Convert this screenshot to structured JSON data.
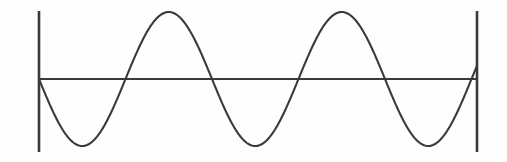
{
  "figure": {
    "kind": "line-diagram",
    "width": 507,
    "height": 162,
    "background_color": "#fefefe",
    "ink_color": "#3a3a3a"
  },
  "chart_data": {
    "type": "line",
    "title": "",
    "subtitle": "",
    "xlabel": "",
    "ylabel": "",
    "grid": false,
    "legend": null,
    "annotations": [],
    "xlim": [
      39,
      477
    ],
    "ylim": [
      11,
      152
    ],
    "baseline_y": 79,
    "amplitude_px": 67,
    "period_px": 173,
    "cycles": 2.53,
    "phase": "starts at zero descending",
    "axis": {
      "name": "horizontal-baseline",
      "x_start": 39,
      "x_end": 477,
      "y": 79,
      "stroke_width": 1.9,
      "color": "#3a3a3a"
    },
    "end_bars": [
      {
        "name": "left-end-bar",
        "x": 39,
        "y_top": 11,
        "y_bottom": 152,
        "stroke_width": 2.6,
        "color": "#3a3a3a"
      },
      {
        "name": "right-end-bar",
        "x": 477,
        "y_top": 11,
        "y_bottom": 152,
        "stroke_width": 2.6,
        "color": "#3a3a3a"
      }
    ],
    "wave": {
      "name": "sine-curve",
      "stroke_width": 2.1,
      "color": "#3a3a3a",
      "key_points": [
        {
          "label": "start-zero-descending",
          "x": 39,
          "y": 79
        },
        {
          "label": "trough-1",
          "x": 83,
          "y": 148
        },
        {
          "label": "zero-ascending-1",
          "x": 128,
          "y": 79
        },
        {
          "label": "peak-1",
          "x": 171,
          "y": 12
        },
        {
          "label": "zero-descending-1",
          "x": 213,
          "y": 79
        },
        {
          "label": "trough-2",
          "x": 257,
          "y": 149
        },
        {
          "label": "zero-ascending-2",
          "x": 301,
          "y": 79
        },
        {
          "label": "peak-2",
          "x": 345,
          "y": 13
        },
        {
          "label": "zero-descending-2",
          "x": 387,
          "y": 79
        },
        {
          "label": "trough-3",
          "x": 430,
          "y": 149
        },
        {
          "label": "end-zero-ascending",
          "x": 477,
          "y": 79
        }
      ],
      "path_d": "M 39 79 C 46.2 101.6 55.5 125.4 66.9 138.8 C 72.6 145.5 78.0 148.3 83.0 148.0 C 88.0 147.7 93.3 144.4 98.9 137.9 C 110.2 124.9 119.6 102.9 128.0 79.0 C 136.0 56.0 144.8 34.1 155.8 20.5 C 161.3 13.7 166.3 11.4 171.0 12.0 C 175.7 12.6 180.3 16.1 185.1 23.0 C 194.6 36.8 203.9 57.8 213.0 79.0 C 221.4 101.6 230.3 125.8 241.3 139.2 C 246.8 145.9 252.0 148.7 257.0 149.0 C 262.0 149.3 267.3 146.2 273.0 139.8 C 284.4 127.0 293.2 103.6 301.0 79.0 C 309.0 55.9 318.0 34.8 328.9 21.3 C 334.3 14.5 339.6 12.2 345.0 13.0 C 350.4 13.8 355.2 17.7 359.9 24.5 C 369.3 38.0 378.4 58.3 387.0 79.0 C 395.3 101.9 404.1 126.1 415.0 139.5 C 420.4 146.2 425.5 149.0 430.0 149.0 C 434.5 149.0 439.7 146.0 445.6 139.6 C 457.4 126.8 467.9 102.8 477.0 79.0"
    }
  }
}
